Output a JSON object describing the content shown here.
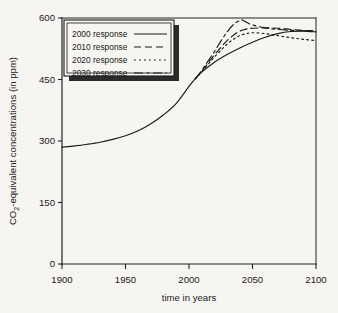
{
  "chart_data": {
    "type": "line",
    "title": "",
    "xlabel": "time in years",
    "ylabel": "CO2-equivalent concentrations  (in ppm)",
    "ylabel_main": "-equivalent concentrations  (in ppm)",
    "ylabel_prefix": "CO",
    "ylabel_subscript": "2",
    "xlim": [
      1900,
      2100
    ],
    "ylim": [
      0,
      600
    ],
    "xticks": [
      1900,
      1950,
      2000,
      2050,
      2100
    ],
    "yticks": [
      0,
      150,
      300,
      450,
      600
    ],
    "xticklabels": [
      "1900",
      "1950",
      "2000",
      "2050",
      "2100"
    ],
    "yticklabels": [
      "0",
      "150",
      "300",
      "450",
      "600"
    ],
    "grid": false,
    "legend_position": "upper left",
    "series": [
      {
        "name": "2000 response",
        "style": "solid",
        "x": [
          1900,
          1910,
          1920,
          1930,
          1940,
          1950,
          1960,
          1970,
          1980,
          1990,
          2000,
          2005,
          2010,
          2020,
          2030,
          2040,
          2050,
          2060,
          2070,
          2080,
          2090,
          2100
        ],
        "y": [
          285,
          288,
          292,
          297,
          304,
          313,
          325,
          342,
          364,
          392,
          433,
          452,
          468,
          492,
          511,
          527,
          541,
          553,
          562,
          567,
          568,
          566
        ]
      },
      {
        "name": "2010 response",
        "style": "dashed",
        "x": [
          2005,
          2010,
          2015,
          2020,
          2025,
          2030,
          2035,
          2040,
          2045,
          2050,
          2060,
          2070,
          2080,
          2090,
          2100
        ],
        "y": [
          452,
          470,
          490,
          510,
          528,
          545,
          558,
          568,
          573,
          575,
          576,
          575,
          572,
          570,
          568
        ]
      },
      {
        "name": "2020 response",
        "style": "dotted",
        "x": [
          2005,
          2010,
          2015,
          2020,
          2025,
          2030,
          2035,
          2040,
          2045,
          2050,
          2060,
          2070,
          2080,
          2090,
          2100
        ],
        "y": [
          452,
          469,
          487,
          505,
          521,
          536,
          548,
          557,
          562,
          564,
          562,
          557,
          552,
          548,
          545
        ]
      },
      {
        "name": "2030 response",
        "style": "dashdot",
        "x": [
          2005,
          2010,
          2015,
          2020,
          2025,
          2030,
          2035,
          2040,
          2042,
          2045,
          2050,
          2060,
          2070,
          2080,
          2090,
          2100
        ],
        "y": [
          452,
          472,
          495,
          518,
          543,
          566,
          584,
          594,
          595,
          590,
          583,
          576,
          572,
          570,
          569,
          568
        ]
      }
    ]
  },
  "legend": {
    "entries": [
      {
        "label": "2000 response",
        "style": "solid"
      },
      {
        "label": "2010 response",
        "style": "dashed"
      },
      {
        "label": "2020 response",
        "style": "dotted"
      },
      {
        "label": "2030 response",
        "style": "dashdot"
      }
    ]
  }
}
